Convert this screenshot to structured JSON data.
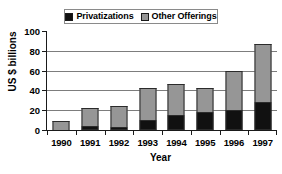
{
  "chart_data": {
    "type": "bar",
    "subtype": "stacked-vertical",
    "title": "",
    "xlabel": "Year",
    "ylabel": "US $ billions",
    "categories": [
      "1990",
      "1991",
      "1992",
      "1993",
      "1994",
      "1995",
      "1996",
      "1997"
    ],
    "series": [
      {
        "name": "Privatizations",
        "color": "#111111",
        "values": [
          0,
          4,
          3,
          10,
          15,
          18,
          20,
          28
        ]
      },
      {
        "name": "Other Offerings",
        "color": "#969696",
        "values": [
          9,
          18,
          21,
          32,
          31,
          24,
          40,
          59
        ]
      }
    ],
    "totals": [
      9,
      22,
      24,
      42,
      46,
      42,
      60,
      87
    ],
    "ylim": [
      0,
      100
    ],
    "yticks": [
      0,
      20,
      40,
      60,
      80,
      100
    ],
    "ytick_labels": [
      "0",
      "20",
      "40",
      "60",
      "80",
      "100"
    ],
    "grid": true,
    "grid_axis": "y",
    "legend_position": "top-center",
    "legend_entries": [
      "Privatizations",
      "Other Offerings"
    ]
  },
  "legend": {
    "entries": [
      {
        "label": "Privatizations",
        "swatch": "black-square-swatch"
      },
      {
        "label": "Other Offerings",
        "swatch": "gray-square-swatch"
      }
    ]
  },
  "axes": {
    "y": {
      "title": "US $ billions",
      "ticks": [
        {
          "value": 100,
          "label": "100"
        },
        {
          "value": 80,
          "label": "80"
        },
        {
          "value": 60,
          "label": "60"
        },
        {
          "value": 40,
          "label": "40"
        },
        {
          "value": 20,
          "label": "20"
        },
        {
          "value": 0,
          "label": "0"
        }
      ]
    },
    "x": {
      "title": "Year",
      "ticks": [
        {
          "label": "1990"
        },
        {
          "label": "1991"
        },
        {
          "label": "1992"
        },
        {
          "label": "1993"
        },
        {
          "label": "1994"
        },
        {
          "label": "1995"
        },
        {
          "label": "1996"
        },
        {
          "label": "1997"
        }
      ]
    }
  }
}
